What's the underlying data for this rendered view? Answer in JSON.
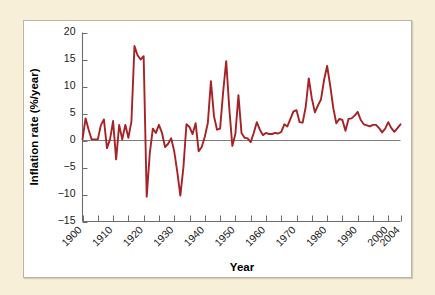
{
  "figure": {
    "background_color": "#f7efd8",
    "panel_color": "#ffffff",
    "panel_border_color": "#b9b4a4",
    "line_color": "#a52226",
    "axis_color": "#6d6d6d"
  },
  "axes": {
    "ylabel": "Inflation rate (%/year)",
    "xlabel": "Year",
    "y_ticks": [
      "20",
      "15",
      "10",
      "5",
      "0",
      "−5",
      "−10",
      "−15"
    ],
    "x_ticks": [
      "1900",
      "1910",
      "1920",
      "1930",
      "1940",
      "1950",
      "1960",
      "1970",
      "1980",
      "1990",
      "2000",
      "2004"
    ]
  },
  "chart_data": {
    "type": "line",
    "title": "",
    "xlabel": "Year",
    "ylabel": "Inflation rate (%/year)",
    "xlim": [
      1900,
      2004
    ],
    "ylim": [
      -15,
      20
    ],
    "y_tick_values": [
      20,
      15,
      10,
      5,
      0,
      -5,
      -10,
      -15
    ],
    "x_tick_values": [
      1900,
      1910,
      1920,
      1930,
      1940,
      1950,
      1960,
      1970,
      1980,
      1990,
      2000,
      2004
    ],
    "x_minor_tick_step": 5,
    "grid": false,
    "legend": null,
    "zero_reference_line": 0,
    "series": [
      {
        "name": "Inflation rate",
        "color": "#a52226",
        "x": [
          1900,
          1901,
          1902,
          1903,
          1904,
          1905,
          1906,
          1907,
          1908,
          1909,
          1910,
          1911,
          1912,
          1913,
          1914,
          1915,
          1916,
          1917,
          1918,
          1919,
          1920,
          1921,
          1922,
          1923,
          1924,
          1925,
          1926,
          1927,
          1928,
          1929,
          1930,
          1931,
          1932,
          1933,
          1934,
          1935,
          1936,
          1937,
          1938,
          1939,
          1940,
          1941,
          1942,
          1943,
          1944,
          1945,
          1946,
          1947,
          1948,
          1949,
          1950,
          1951,
          1952,
          1953,
          1954,
          1955,
          1956,
          1957,
          1958,
          1959,
          1960,
          1961,
          1962,
          1963,
          1964,
          1965,
          1966,
          1967,
          1968,
          1969,
          1970,
          1971,
          1972,
          1973,
          1974,
          1975,
          1976,
          1977,
          1978,
          1979,
          1980,
          1981,
          1982,
          1983,
          1984,
          1985,
          1986,
          1987,
          1988,
          1989,
          1990,
          1991,
          1992,
          1993,
          1994,
          1995,
          1996,
          1997,
          1998,
          1999,
          2000,
          2001,
          2002,
          2003,
          2004
        ],
        "y": [
          0.2,
          4.1,
          2.0,
          0.2,
          0.2,
          0.2,
          2.8,
          3.9,
          -1.4,
          0.2,
          3.6,
          -3.5,
          2.9,
          0.2,
          2.9,
          0.5,
          3.5,
          17.5,
          15.8,
          15.0,
          15.6,
          -10.4,
          -2.4,
          2.2,
          1.4,
          2.9,
          1.4,
          -1.2,
          -0.6,
          0.4,
          -2.0,
          -5.8,
          -10.2,
          -5.0,
          3.0,
          2.5,
          1.2,
          3.2,
          -2.0,
          -1.2,
          0.7,
          3.3,
          11.0,
          4.5,
          2.0,
          2.2,
          9.0,
          14.7,
          6.0,
          -1.0,
          1.2,
          8.4,
          1.4,
          0.5,
          0.4,
          -0.3,
          1.4,
          3.4,
          2.0,
          1.0,
          1.4,
          1.2,
          1.2,
          1.4,
          1.3,
          1.6,
          3.0,
          2.6,
          4.0,
          5.4,
          5.6,
          3.4,
          3.3,
          6.2,
          11.5,
          7.8,
          5.2,
          6.5,
          7.6,
          11.2,
          13.8,
          10.2,
          6.1,
          3.2,
          4.0,
          3.8,
          1.8,
          4.0,
          4.1,
          4.6,
          5.3,
          3.8,
          3.0,
          2.8,
          2.6,
          2.9,
          2.9,
          2.3,
          1.5,
          2.2,
          3.4,
          2.3,
          1.6,
          2.3,
          3.0
        ]
      }
    ]
  }
}
